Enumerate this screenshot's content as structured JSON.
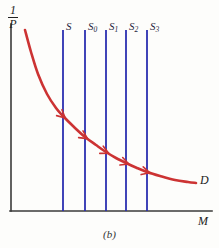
{
  "figure": {
    "caption": "(b)",
    "background_color": "#fdfdfb"
  },
  "axes": {
    "y_label_numerator": "1",
    "y_label_denominator": "P",
    "x_label": "M",
    "axis_color": "#3a3a3a",
    "origin_px": {
      "x": 11,
      "y": 211
    },
    "x_axis_end_px": 212,
    "y_axis_top_px": 24
  },
  "curve": {
    "label": "D",
    "color": "#cc3333",
    "width_px": 2.6,
    "description": "downward-sloping convex money demand curve"
  },
  "supply_lines": {
    "color": "#2b2fb0",
    "width_px": 1.8,
    "top_px": 30,
    "bottom_px": 211,
    "items": [
      {
        "label": "S",
        "sub": "",
        "x_px": 63
      },
      {
        "label": "S",
        "sub": "0",
        "x_px": 85
      },
      {
        "label": "S",
        "sub": "1",
        "x_px": 106
      },
      {
        "label": "S",
        "sub": "2",
        "x_px": 126
      },
      {
        "label": "S",
        "sub": "3",
        "x_px": 147
      }
    ]
  },
  "chart_data": {
    "type": "line",
    "title": "",
    "subtitle": "",
    "xlabel": "M",
    "ylabel": "1/P",
    "grid": false,
    "legend": null,
    "xlim": [
      11,
      212
    ],
    "ylim": [
      211,
      24
    ],
    "series": [
      {
        "name": "D",
        "type": "curve",
        "color": "#cc3333",
        "label": "D",
        "points_px": [
          {
            "x": 25,
            "y": 30
          },
          {
            "x": 31,
            "y": 52
          },
          {
            "x": 38,
            "y": 74
          },
          {
            "x": 47,
            "y": 94
          },
          {
            "x": 56,
            "y": 108
          },
          {
            "x": 63,
            "y": 116
          },
          {
            "x": 74,
            "y": 127
          },
          {
            "x": 85,
            "y": 137
          },
          {
            "x": 96,
            "y": 145
          },
          {
            "x": 106,
            "y": 152
          },
          {
            "x": 116,
            "y": 158
          },
          {
            "x": 126,
            "y": 163
          },
          {
            "x": 137,
            "y": 168
          },
          {
            "x": 147,
            "y": 172
          },
          {
            "x": 160,
            "y": 176
          },
          {
            "x": 175,
            "y": 180
          },
          {
            "x": 188,
            "y": 182
          },
          {
            "x": 196,
            "y": 183
          }
        ]
      },
      {
        "name": "supply",
        "type": "vertical-lines",
        "color": "#2b2fb0",
        "x_values_px": [
          63,
          85,
          106,
          126,
          147
        ],
        "labels": [
          "S",
          "S0",
          "S1",
          "S2",
          "S3"
        ]
      }
    ],
    "annotations": [
      {
        "kind": "arrowhead",
        "x_px": 63,
        "y_px": 116,
        "angle_deg": 42
      },
      {
        "kind": "arrowhead",
        "x_px": 85,
        "y_px": 137,
        "angle_deg": 33
      },
      {
        "kind": "arrowhead",
        "x_px": 106,
        "y_px": 152,
        "angle_deg": 26
      },
      {
        "kind": "arrowhead",
        "x_px": 126,
        "y_px": 163,
        "angle_deg": 20
      },
      {
        "kind": "arrowhead",
        "x_px": 147,
        "y_px": 172,
        "angle_deg": 15
      }
    ]
  }
}
